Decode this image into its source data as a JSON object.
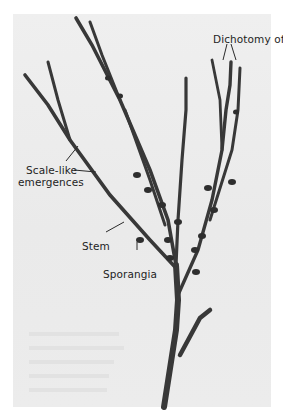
{
  "figure": {
    "background_color": "#ececec",
    "border_color": "#ffffff",
    "stem_color": "#3a3a3a"
  },
  "labels": {
    "dichotomy": "Dichotomy of stem",
    "scale_like_1": "Scale-like",
    "scale_like_2": "emergences",
    "stem": "Stem",
    "sporangia": "Sporangia"
  }
}
